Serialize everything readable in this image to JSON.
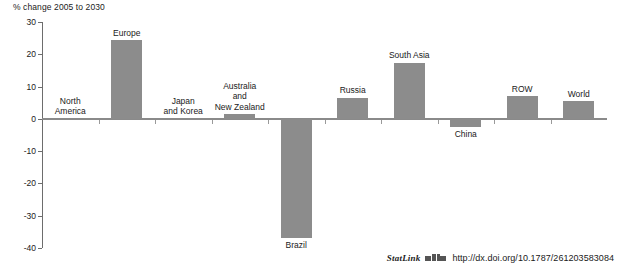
{
  "chart_data": {
    "type": "bar",
    "title": "",
    "subtitle": "",
    "axis_caption": "% change 2005 to 2030",
    "xlabel": "",
    "ylabel": "% change 2005 to 2030",
    "ylim": [
      -40,
      30
    ],
    "yticks": [
      30,
      20,
      10,
      0,
      -10,
      -20,
      -30,
      -40
    ],
    "ytick_labels": [
      "30",
      "20",
      "10",
      "0",
      "-10",
      "-20",
      "-30",
      "-40"
    ],
    "grid": false,
    "legend": "none",
    "bar_color": "#8c8c8c",
    "categories": [
      "North America",
      "Europe",
      "Japan and Korea",
      "Australia and New Zealand",
      "Brazil",
      "Russia",
      "South Asia",
      "China",
      "ROW",
      "World"
    ],
    "category_labels": [
      "North\nAmerica",
      "Europe",
      "Japan\nand Korea",
      "Australia\nand\nNew Zealand",
      "Brazil",
      "Russia",
      "South Asia",
      "China",
      "ROW",
      "World"
    ],
    "values": [
      0,
      24.3,
      0,
      1.5,
      -37,
      6.6,
      17.4,
      -2.5,
      7,
      5.4
    ]
  },
  "footer": {
    "statlink_label": "StatLink",
    "statlink_icon": "statlink-2d-icon",
    "url": "http://dx.doi.org/10.1787/261203583084"
  }
}
